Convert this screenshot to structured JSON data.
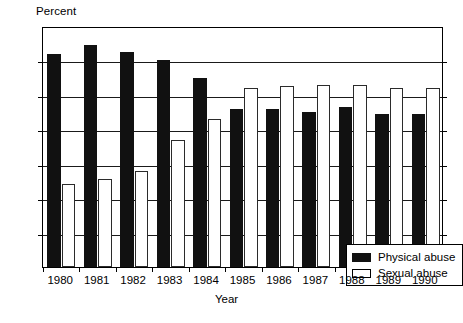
{
  "chart_data": {
    "type": "bar",
    "title": "",
    "subtitle": "",
    "ylabel": "Percent",
    "xlabel": "Year",
    "ylim": [
      0,
      70
    ],
    "ytick_step": 10,
    "yticks": [
      0,
      10,
      20,
      30,
      40,
      50,
      60,
      70
    ],
    "grid": true,
    "grid_axis": "y",
    "legend_position": "inside bottom-right",
    "categories": [
      "1980",
      "1981",
      "1982",
      "1983",
      "1984",
      "1985",
      "1986",
      "1987",
      "1988",
      "1989",
      "1990"
    ],
    "series": [
      {
        "name": "Physical abuse",
        "color": "#111111",
        "values": [
          62,
          64.5,
          62.5,
          60,
          55,
          46,
          46,
          45,
          46.5,
          44.5,
          44.5
        ]
      },
      {
        "name": "Sexual abuse",
        "color": "#ffffff",
        "values": [
          24,
          25.5,
          28,
          37,
          43,
          52,
          52.5,
          53,
          53,
          52,
          52
        ]
      }
    ],
    "annotations": []
  },
  "axes": {
    "ytick_labels": [
      "70",
      "60",
      "50",
      "40",
      "30",
      "20",
      "10",
      "0"
    ],
    "ylabel_text": "Percent",
    "xlabel_text": "Year"
  },
  "legend": {
    "items": [
      {
        "label": "Physical abuse",
        "swatch": "filled-black-square"
      },
      {
        "label": "Sexual abuse",
        "swatch": "open-white-square"
      }
    ]
  }
}
